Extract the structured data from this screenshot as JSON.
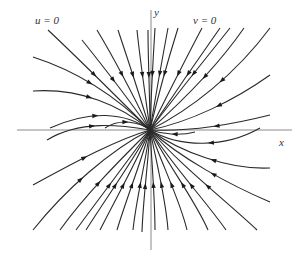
{
  "figure": {
    "type": "phase-portrait",
    "colors": {
      "axis": "#8a8a8a",
      "trajectory": "#2a2a2a",
      "arrow": "#1a1a1a",
      "background": "#ffffff"
    },
    "origin": [
      150,
      130
    ],
    "axes": {
      "x": {
        "label": "x",
        "from": [
          17,
          130
        ],
        "to": [
          292,
          130
        ],
        "label_pos": [
          279,
          137
        ]
      },
      "y": {
        "label": "y",
        "from": [
          151,
          10
        ],
        "to": [
          151,
          250
        ],
        "label_pos": [
          154,
          7
        ]
      }
    },
    "nullcline_labels": [
      {
        "text": "u = 0",
        "pos": [
          35,
          15
        ]
      },
      {
        "text": "v = 0",
        "pos": [
          193,
          15
        ]
      }
    ],
    "trajectories": [
      {
        "d": "M48,30 C80,60 120,100 150,130",
        "arrow": [
          95,
          75,
          45
        ]
      },
      {
        "d": "M33,57 C80,72 120,100 150,130",
        "arrow": [
          88,
          80,
          30
        ]
      },
      {
        "d": "M33,91 C80,88 120,105 150,130",
        "arrow": [
          82,
          93,
          10
        ]
      },
      {
        "d": "M50,128 C90,110 125,112 150,130",
        "arrow": [
          80,
          116,
          -15
        ]
      },
      {
        "d": "M82,40 C110,75 135,108 150,130",
        "arrow": [
          110,
          78,
          55
        ]
      },
      {
        "d": "M97,30 C118,65 138,105 150,130",
        "arrow": [
          120,
          68,
          62
        ]
      },
      {
        "d": "M118,30 C128,60 142,102 150,130",
        "arrow": [
          131,
          67,
          70
        ]
      },
      {
        "d": "M137,30 C140,60 146,100 150,130",
        "arrow": [
          141,
          61,
          82
        ]
      },
      {
        "d": "M148,30 C148,60 150,100 150,130",
        "arrow": [
          149,
          60,
          88
        ]
      },
      {
        "d": "M155,28 C153,60 151,100 150,130",
        "arrow": [
          154,
          62,
          95
        ]
      },
      {
        "d": "M168,28 C162,60 155,100 150,130",
        "arrow": [
          159,
          62,
          100
        ]
      },
      {
        "d": "M178,28 C168,60 157,100 150,130",
        "arrow": [
          165,
          65,
          105
        ]
      },
      {
        "d": "M202,28 C185,60 165,100 150,130",
        "arrow": [
          182,
          70,
          115
        ]
      },
      {
        "d": "M220,28 C196,62 170,100 150,130",
        "arrow": [
          197,
          78,
          122
        ]
      },
      {
        "d": "M230,28 C203,62 172,100 150,130",
        "arrow": [
          198,
          80,
          125
        ]
      },
      {
        "d": "M244,28 C215,70 178,105 150,130",
        "arrow": [
          205,
          86,
          130
        ]
      },
      {
        "d": "M270,28 C235,75 190,110 150,130",
        "arrow": [
          215,
          88,
          135
        ]
      },
      {
        "d": "M270,75 C235,100 190,122 150,130",
        "arrow": [
          212,
          96,
          150
        ]
      },
      {
        "d": "M270,115 C230,125 190,132 150,130",
        "arrow": [
          222,
          116,
          165
        ]
      },
      {
        "d": "M260,128 C225,148 180,148 150,130",
        "arrow": [
          227,
          143,
          170
        ]
      },
      {
        "d": "M270,168 C230,170 180,152 150,130",
        "arrow": [
          223,
          168,
          195
        ]
      },
      {
        "d": "M270,202 C230,185 180,158 150,130",
        "arrow": [
          220,
          180,
          205
        ]
      },
      {
        "d": "M257,230 C225,200 180,165 150,130",
        "arrow": [
          212,
          188,
          220
        ]
      },
      {
        "d": "M226,230 C205,200 172,165 150,130",
        "arrow": [
          205,
          198,
          232
        ]
      },
      {
        "d": "M208,230 C195,200 168,165 150,130",
        "arrow": [
          195,
          198,
          238
        ]
      },
      {
        "d": "M187,230 C180,200 162,165 150,130",
        "arrow": [
          183,
          198,
          250
        ]
      },
      {
        "d": "M168,230 C166,200 157,165 150,130",
        "arrow": [
          166,
          198,
          260
        ]
      },
      {
        "d": "M155,230 C155,200 152,165 150,130",
        "arrow": [
          155,
          198,
          268
        ]
      },
      {
        "d": "M142,232 C143,200 148,165 150,130",
        "arrow": [
          144,
          200,
          275
        ]
      },
      {
        "d": "M133,230 C136,200 145,165 150,130",
        "arrow": [
          139,
          195,
          278
        ]
      },
      {
        "d": "M117,230 C126,200 140,165 150,130",
        "arrow": [
          128,
          195,
          285
        ]
      },
      {
        "d": "M100,230 C115,200 135,165 150,130",
        "arrow": [
          116,
          183,
          292
        ]
      },
      {
        "d": "M86,230 C105,200 130,165 150,130",
        "arrow": [
          112,
          175,
          296
        ]
      },
      {
        "d": "M76,230 C98,200 127,162 150,130",
        "arrow": [
          105,
          172,
          298
        ]
      },
      {
        "d": "M60,230 C85,195 120,160 150,130",
        "arrow": [
          96,
          168,
          300
        ]
      },
      {
        "d": "M33,230 C65,190 110,150 150,130",
        "arrow": [
          97,
          158,
          305
        ]
      },
      {
        "d": "M33,185 C70,165 115,140 150,130",
        "arrow": [
          86,
          140,
          320
        ]
      },
      {
        "d": "M47,140 C80,120 120,125 150,130",
        "arrow": [
          80,
          121,
          340
        ]
      },
      {
        "d": "M105,128 C120,118 140,122 150,130",
        "arrow": [
          124,
          120,
          350
        ]
      },
      {
        "d": "M195,132 C180,136 162,134 150,130",
        "arrow": [
          178,
          134,
          175
        ]
      }
    ]
  }
}
